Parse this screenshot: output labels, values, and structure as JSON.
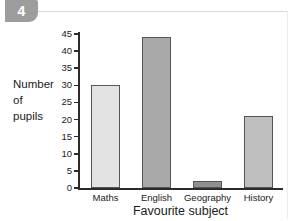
{
  "question": {
    "number": "4"
  },
  "chart_data": {
    "type": "bar",
    "title": "",
    "categories": [
      "Maths",
      "English",
      "Geography",
      "History"
    ],
    "values": [
      30,
      44,
      2,
      21
    ],
    "bar_colors": [
      "#e3e3e3",
      "#a9a9a9",
      "#8f8f8f",
      "#bfbfbf"
    ],
    "bar_border_color": "#555555",
    "xlabel": "Favourite subject",
    "ylabel_lines": [
      "Number",
      "of",
      "pupils"
    ],
    "ylabel": "Number of pupils",
    "ylim": [
      0,
      45
    ],
    "ytick_step": 5,
    "yticks": [
      0,
      5,
      10,
      15,
      20,
      25,
      30,
      35,
      40,
      45
    ],
    "ytick_labels": [
      "0",
      "5",
      "10",
      "15",
      "20",
      "25",
      "30",
      "35",
      "40",
      "45"
    ],
    "grid": false,
    "legend": false
  }
}
